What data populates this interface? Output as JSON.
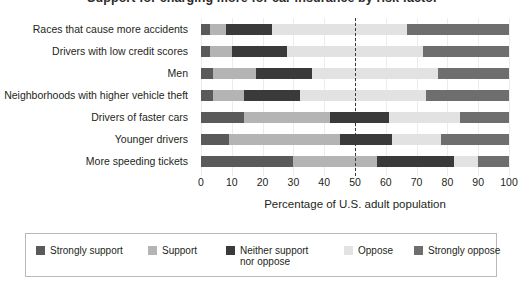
{
  "title": "Support for charging more for car insurance by risk factor",
  "axis": {
    "xlabel": "Percentage of U.S. adult population",
    "ticks": [
      "0",
      "10",
      "20",
      "30",
      "40",
      "50",
      "60",
      "70",
      "80",
      "90",
      "100"
    ],
    "reference_line": "50"
  },
  "legend": {
    "items": [
      {
        "label": "Strongly support",
        "color": "#5a5a5a"
      },
      {
        "label": "Support",
        "color": "#b4b4b4"
      },
      {
        "label": "Neither support\nnor oppose",
        "line1": "Neither support",
        "line2": "nor oppose",
        "color": "#3a3a3a"
      },
      {
        "label": "Oppose",
        "color": "#e2e2e2"
      },
      {
        "label": "Strongly oppose",
        "color": "#6e6e6e"
      }
    ]
  },
  "chart_data": {
    "type": "bar",
    "subtype": "stacked-horizontal-100pct-likert",
    "title": "Support for charging more for car insurance by risk factor",
    "xlabel": "Percentage of U.S. adult population",
    "ylabel": "",
    "xlim": [
      0,
      100
    ],
    "xticks": [
      0,
      10,
      20,
      30,
      40,
      50,
      60,
      70,
      80,
      90,
      100
    ],
    "grid": true,
    "legend_position": "bottom",
    "reference_line_x": 50,
    "categories": [
      "Races that cause more accidents",
      "Drivers with low credit scores",
      "Men",
      "Neighborhoods with higher vehicle theft",
      "Drivers of faster cars",
      "Younger drivers",
      "More speeding tickets"
    ],
    "series": [
      {
        "name": "Strongly support",
        "color": "#5a5a5a",
        "values": [
          3,
          3,
          4,
          4,
          14,
          9,
          30
        ]
      },
      {
        "name": "Support",
        "color": "#b4b4b4",
        "values": [
          5,
          7,
          14,
          10,
          28,
          36,
          27
        ]
      },
      {
        "name": "Neither support nor oppose",
        "color": "#3a3a3a",
        "values": [
          15,
          18,
          18,
          18,
          19,
          17,
          25
        ]
      },
      {
        "name": "Oppose",
        "color": "#e2e2e2",
        "values": [
          44,
          44,
          41,
          41,
          23,
          16,
          8
        ]
      },
      {
        "name": "Strongly oppose",
        "color": "#6e6e6e",
        "values": [
          33,
          28,
          23,
          27,
          16,
          22,
          10
        ]
      }
    ]
  }
}
